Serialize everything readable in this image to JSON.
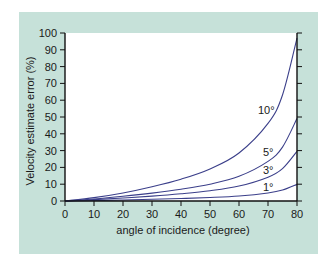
{
  "chart_data": {
    "type": "line",
    "title": "",
    "xlabel": "angle of incidence (degree)",
    "ylabel": "Velocity estimate error (%)",
    "xlim": [
      0,
      80
    ],
    "ylim": [
      0,
      100
    ],
    "xticks": [
      0,
      10,
      20,
      30,
      40,
      50,
      60,
      70,
      80
    ],
    "yticks": [
      0,
      10,
      20,
      30,
      40,
      50,
      60,
      70,
      80,
      90,
      100
    ],
    "grid": false,
    "legend": "inline labels near right end of curves",
    "x": [
      0,
      10,
      20,
      30,
      40,
      50,
      60,
      70,
      75,
      80
    ],
    "series": [
      {
        "name": "1°",
        "label": "1°",
        "values": [
          0,
          0.3,
          0.6,
          1.0,
          1.5,
          2.1,
          3.0,
          4.8,
          6.5,
          9.9
        ]
      },
      {
        "name": "3°",
        "label": "3°",
        "values": [
          0,
          0.8,
          1.8,
          2.9,
          4.3,
          6.1,
          8.9,
          14.2,
          19.3,
          29.6
        ]
      },
      {
        "name": "5°",
        "label": "5°",
        "values": [
          0,
          1.2,
          2.8,
          4.7,
          7.0,
          10.0,
          14.7,
          23.6,
          32.1,
          49.1
        ]
      },
      {
        "name": "10°",
        "label": "10°",
        "values": [
          0,
          2.0,
          4.8,
          8.5,
          13.0,
          19.1,
          28.6,
          46.2,
          63.1,
          97.0
        ]
      }
    ],
    "colors": {
      "curve": "#3b3f8a",
      "panel": "#c6e1d9",
      "plot_bg": "#ffffff",
      "axis": "#111111"
    }
  }
}
